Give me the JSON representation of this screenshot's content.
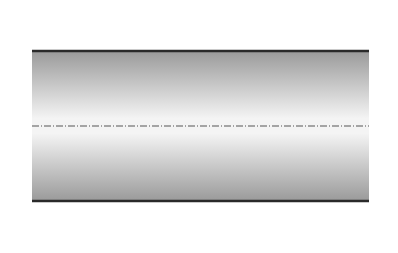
{
  "diagram": {
    "labels": {
      "shear_symbol": "τ",
      "shear_subscript": "w"
    },
    "colors": {
      "arrow_green": "#5aa050",
      "velocity_arrow": "#4f8a46",
      "wall": "#2a2a2a",
      "profile_curve": "#333333",
      "centerline": "#555555"
    },
    "profiles": [
      {
        "name": "profile-1",
        "velocity_arrow_count": 9,
        "shape": "parabolic"
      },
      {
        "name": "profile-2",
        "velocity_arrow_count": 9,
        "shape": "parabolic"
      }
    ],
    "wall_shear_arrows": [
      {
        "name": "top-left",
        "direction": "left"
      },
      {
        "name": "top-right",
        "direction": "left"
      },
      {
        "name": "bottom-left",
        "direction": "left"
      },
      {
        "name": "bottom-right",
        "direction": "left"
      }
    ]
  }
}
